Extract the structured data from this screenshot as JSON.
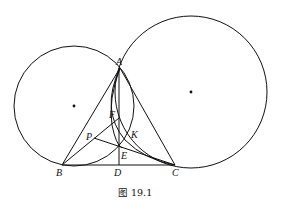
{
  "figure": {
    "caption": "图 19.1",
    "points": {
      "A": "A",
      "B": "B",
      "C": "C",
      "D": "D",
      "E": "E",
      "F": "F",
      "K": "K",
      "P": "P"
    },
    "elements": [
      "circle through A and B (left, with center dot)",
      "circle through A and C (right, with center dot)",
      "arc through A, K, C",
      "triangle ABC",
      "altitude AD",
      "segments BF, PC"
    ]
  }
}
